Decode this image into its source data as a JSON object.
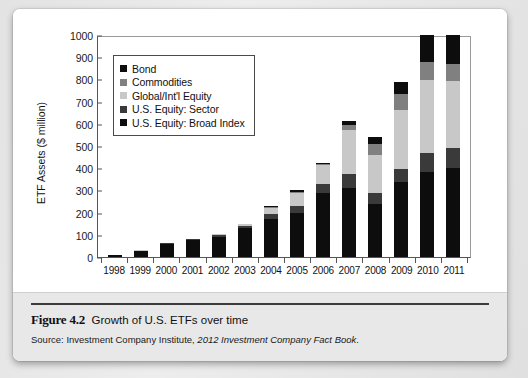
{
  "figure": {
    "number": "Figure 4.2",
    "title": "Growth of U.S. ETFs over time",
    "source_prefix": "Source: Investment Company Institute, ",
    "source_italic": "2012 Investment Company Fact Book",
    "source_suffix": "."
  },
  "chart_data": {
    "type": "bar",
    "stacked": true,
    "title": "Growth of U.S. ETFs over time",
    "xlabel": "",
    "ylabel": "ETF Assets ($ million)",
    "ylim": [
      0,
      1000
    ],
    "yticks": [
      0,
      100,
      200,
      300,
      400,
      500,
      600,
      700,
      800,
      900,
      1000
    ],
    "ytick_labels": [
      "0",
      "100",
      "200",
      "300",
      "400",
      "500",
      "600",
      "700",
      "800",
      "900",
      "1000"
    ],
    "grid": false,
    "legend_position": "upper-left-inside",
    "categories": [
      "1998",
      "1999",
      "2000",
      "2001",
      "2002",
      "2003",
      "2004",
      "2005",
      "2006",
      "2007",
      "2008",
      "2009",
      "2010",
      "2011"
    ],
    "series": [
      {
        "name": "U.S. Equity: Broad Index",
        "color": "#0d0d0d",
        "values": [
          10,
          28,
          60,
          76,
          92,
          130,
          172,
          200,
          288,
          312,
          240,
          337,
          383,
          400
        ]
      },
      {
        "name": "U.S. Equity: Sector",
        "color": "#3a3a3a",
        "values": [
          0,
          1,
          3,
          4,
          6,
          11,
          24,
          28,
          40,
          64,
          50,
          60,
          86,
          93
        ]
      },
      {
        "name": "Global/Int'l Equity",
        "color": "#c8c8c8",
        "values": [
          0,
          1,
          2,
          3,
          5,
          7,
          26,
          62,
          85,
          195,
          170,
          265,
          330,
          302
        ]
      },
      {
        "name": "Commodities",
        "color": "#808080",
        "values": [
          0,
          0,
          0,
          0,
          0,
          0,
          2,
          4,
          6,
          22,
          50,
          73,
          78,
          75
        ]
      },
      {
        "name": "Bond",
        "color": "#0d0d0d",
        "values": [
          0,
          0,
          0,
          0,
          2,
          2,
          6,
          6,
          6,
          22,
          30,
          55,
          123,
          130
        ]
      }
    ],
    "totals": [
      10,
      30,
      65,
      83,
      105,
      150,
      230,
      300,
      425,
      615,
      540,
      790,
      1000,
      1000
    ],
    "legend_order_top_to_bottom": [
      "Bond",
      "Commodities",
      "Global/Int'l Equity",
      "U.S. Equity: Sector",
      "U.S. Equity: Broad Index"
    ]
  }
}
